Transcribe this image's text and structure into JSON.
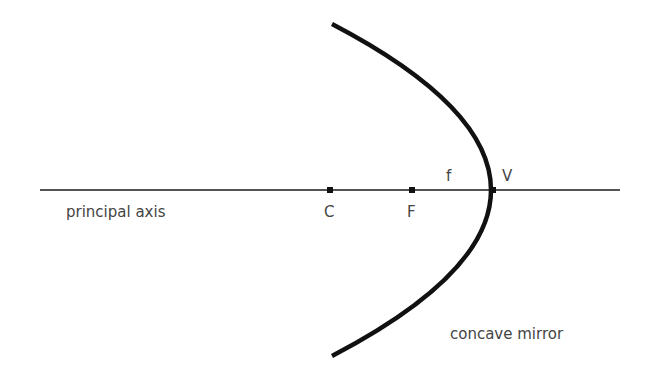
{
  "diagram": {
    "type": "concave-mirror-ray-diagram",
    "colors": {
      "line": "#1a1a1a",
      "mirror": "#111111",
      "text": "#444444",
      "background": "#ffffff"
    },
    "axis": {
      "label": "principal axis",
      "x1": 40,
      "x2": 620,
      "y": 190
    },
    "mirror": {
      "label": "concave mirror",
      "top": [
        332,
        24
      ],
      "vertex": [
        493,
        190
      ],
      "bottom": [
        332,
        356
      ]
    },
    "points": [
      {
        "id": "C",
        "label": "C",
        "x": 330,
        "y": 190
      },
      {
        "id": "F",
        "label": "F",
        "x": 412,
        "y": 190
      },
      {
        "id": "V",
        "label": "V",
        "x": 493,
        "y": 190
      }
    ],
    "focal_length_label": "f"
  }
}
